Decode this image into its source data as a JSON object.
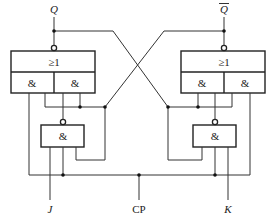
{
  "diagram": {
    "type": "JK flip-flop (master-slave, AND-OR-INVERT implementation)",
    "signals": {
      "q": "Q",
      "q_bar": "Q",
      "j": "J",
      "cp": "CP",
      "k": "K"
    },
    "gates": {
      "left_nor": {
        "label": "≥1",
        "and_left": "&",
        "and_right": "&"
      },
      "right_nor": {
        "label": "≥1",
        "and_left": "&",
        "and_right": "&"
      },
      "left_nand": {
        "label": "&"
      },
      "right_nand": {
        "label": "&"
      }
    },
    "colors": {
      "line": "#333333",
      "background": "#ffffff"
    }
  }
}
